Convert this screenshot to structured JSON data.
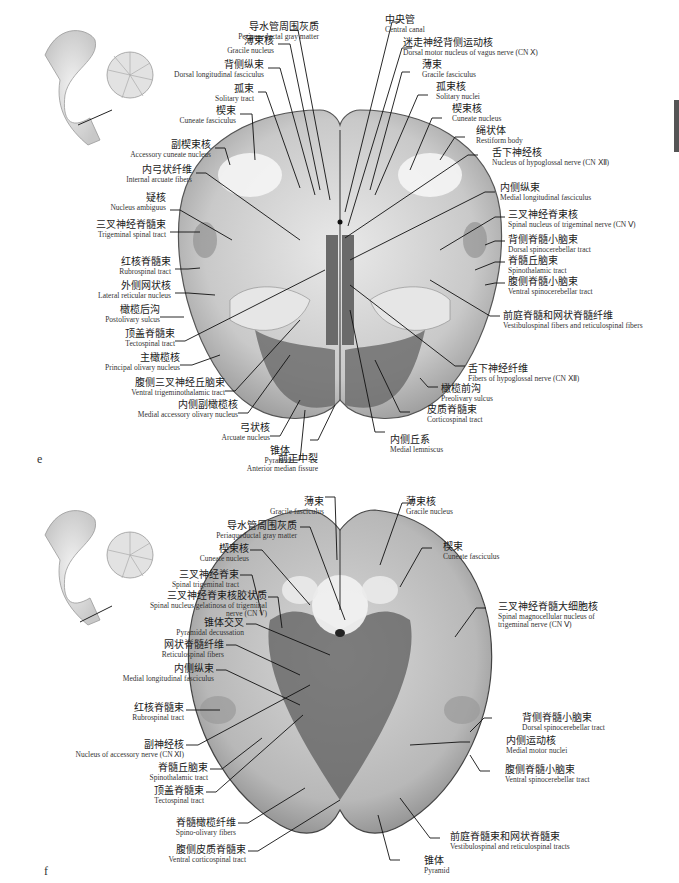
{
  "panel_e": {
    "letter": "e",
    "labels_left": [
      {
        "zh": "导水管周围灰质",
        "en": "Periaqueductal gray matter"
      },
      {
        "zh": "薄束核",
        "en": "Gracile nucleus"
      },
      {
        "zh": "背侧纵束",
        "en": "Dorsal longitudinal fasciculus"
      },
      {
        "zh": "孤束",
        "en": "Solitary tract"
      },
      {
        "zh": "楔束",
        "en": "Cuneate fasciculus"
      },
      {
        "zh": "副楔束核",
        "en": "Accessory cuneate nucleus"
      },
      {
        "zh": "内弓状纤维",
        "en": "Internal arcuate fibers"
      },
      {
        "zh": "疑核",
        "en": "Nucleus ambiguus"
      },
      {
        "zh": "三叉神经脊髓束",
        "en": "Trigeminal spinal tract"
      },
      {
        "zh": "红核脊髓束",
        "en": "Rubrospinal tract"
      },
      {
        "zh": "外侧网状核",
        "en": "Lateral reticular nucleus"
      },
      {
        "zh": "橄榄后沟",
        "en": "Postolivary sulcus"
      },
      {
        "zh": "顶盖脊髓束",
        "en": "Tectospinal tract"
      },
      {
        "zh": "主橄榄核",
        "en": "Principal olivary nucleus"
      },
      {
        "zh": "腹侧三叉神经丘脑束",
        "en": "Ventral trigeminothalamic tract"
      },
      {
        "zh": "内侧副橄榄核",
        "en": "Medial accessory olivary nucleus"
      },
      {
        "zh": "弓状核",
        "en": "Arcuate nucleus"
      },
      {
        "zh": "锥体",
        "en": "Pyramid"
      },
      {
        "zh": "前正中裂",
        "en": "Anterior median fissure"
      }
    ],
    "labels_right": [
      {
        "zh": "中央管",
        "en": "Central canal"
      },
      {
        "zh": "迷走神经背侧运动核",
        "en": "Dorsal motor nucleus of vagus nerve (CN Ⅹ)"
      },
      {
        "zh": "薄束",
        "en": "Gracile fasciculus"
      },
      {
        "zh": "孤束核",
        "en": "Solitary nuclei"
      },
      {
        "zh": "楔束核",
        "en": "Cuneate nucleus"
      },
      {
        "zh": "绳状体",
        "en": "Restiform body"
      },
      {
        "zh": "舌下神经核",
        "en": "Nucleus of hypoglossal nerve (CN Ⅻ)"
      },
      {
        "zh": "内侧纵束",
        "en": "Medial longitudinal fasciculus"
      },
      {
        "zh": "三叉神经脊束核",
        "en": "Spinal nucleus of trigeminal nerve (CN Ⅴ)"
      },
      {
        "zh": "背侧脊髓小脑束",
        "en": "Dorsal spinocerebellar tract"
      },
      {
        "zh": "脊髓丘脑束",
        "en": "Spinothalamic tract"
      },
      {
        "zh": "腹侧脊髓小脑束",
        "en": "Ventral spinocerebellar tract"
      },
      {
        "zh": "前庭脊髓和网状脊髓纤维",
        "en": "Vestibulospinal fibers and reticulospinal fibers"
      },
      {
        "zh": "舌下神经纤维",
        "en": "Fibers of hypoglossal nerve (CN Ⅻ)"
      },
      {
        "zh": "橄榄前沟",
        "en": "Preolivary sulcus"
      },
      {
        "zh": "皮质脊髓束",
        "en": "Corticospinal tract"
      },
      {
        "zh": "内侧丘系",
        "en": "Medial lemniscus"
      }
    ]
  },
  "panel_f": {
    "letter": "f",
    "labels_left": [
      {
        "zh": "薄束",
        "en": "Gracile fasciculus"
      },
      {
        "zh": "导水管周围灰质",
        "en": "Periaqueductal gray matter"
      },
      {
        "zh": "楔束核",
        "en": "Cuneate nucleus"
      },
      {
        "zh": "三叉神经脊束",
        "en": "Spinal trigeminal tract"
      },
      {
        "zh": "三叉神经脊束核胶状质",
        "en": "Spinal nucleus gelatinosa of trigeminal nerve (CN V)"
      },
      {
        "zh": "锥体交叉",
        "en": "Pyramidal decussation"
      },
      {
        "zh": "网状脊髓纤维",
        "en": "Reticulospinal fibers"
      },
      {
        "zh": "内侧纵束",
        "en": "Medial longitudinal fasciculus"
      },
      {
        "zh": "红核脊髓束",
        "en": "Rubrospinal tract"
      },
      {
        "zh": "副神经核",
        "en": "Nucleus of accessory nerve (CN Ⅺ)"
      },
      {
        "zh": "脊髓丘脑束",
        "en": "Spinothalamic tract"
      },
      {
        "zh": "顶盖脊髓束",
        "en": "Tectospinal tract"
      },
      {
        "zh": "脊髓橄榄纤维",
        "en": "Spino-olivary fibers"
      },
      {
        "zh": "腹侧皮质脊髓束",
        "en": "Ventral corticospinal tract"
      }
    ],
    "labels_right": [
      {
        "zh": "薄束核",
        "en": "Gracile nucleus"
      },
      {
        "zh": "楔束",
        "en": "Cuneate fasciculus"
      },
      {
        "zh": "三叉神经脊髓大细胞核",
        "en": "Spinal magnocellular nucleus of trigeminal nerve (CN Ⅴ)"
      },
      {
        "zh": "背侧脊髓小脑束",
        "en": "Dorsal spinocerebellar tract"
      },
      {
        "zh": "内侧运动核",
        "en": "Medial motor nuclei"
      },
      {
        "zh": "腹侧脊髓小脑束",
        "en": "Ventral spinocerebellar tract"
      },
      {
        "zh": "前庭脊髓束和网状脊髓束",
        "en": "Vestibulospinal and reticulospinal tracts"
      },
      {
        "zh": "锥体",
        "en": "Pyramid"
      }
    ]
  }
}
